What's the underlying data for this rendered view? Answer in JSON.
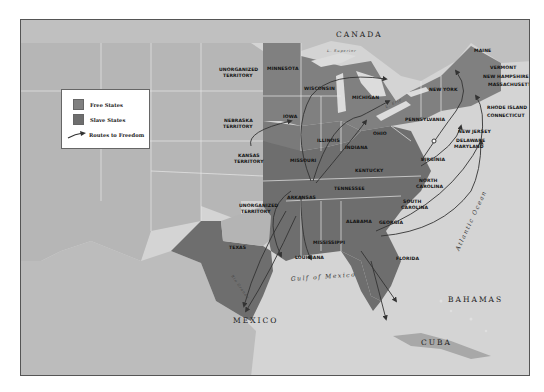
{
  "map": {
    "legend": {
      "items": [
        {
          "label": "Free States",
          "color": "#808080"
        },
        {
          "label": "Slave States",
          "color": "#6e6e6e"
        },
        {
          "label": "Routes to Freedom",
          "icon": "arrow-icon"
        }
      ]
    },
    "regions": {
      "canada": "CANADA",
      "mexico": "MEXICO",
      "bahamas": "BAHAMAS",
      "cuba": "CUBA"
    },
    "water": {
      "gulf": "Gulf of Mexico",
      "atlantic": "Atlantic Ocean",
      "superior": "L. Superior",
      "michigan_lake": "L. Michigan",
      "huron": "L. Huron",
      "erie": "L. Erie",
      "ontario": "L. Ontario",
      "niagara": "Niagara River",
      "st_lawrence": "St. Lawrence River",
      "missouri_river": "Missouri River",
      "arkansas_river": "Arkansas River",
      "ohio_river": "Ohio River",
      "rio_grande": "Rio Grande",
      "mississippi_river": "Mississippi River"
    },
    "territories": {
      "unorganized_north": [
        "UNORGANIZED",
        "TERRITORY"
      ],
      "nebraska": [
        "NEBRASKA",
        "TERRITORY"
      ],
      "kansas": [
        "KANSAS",
        "TERRITORY"
      ],
      "unorganized_south": [
        "UNORGANIZED",
        "TERRITORY"
      ]
    },
    "states": {
      "minnesota": "MINNESOTA",
      "wisconsin": "WISCONSIN",
      "michigan": "MICHIGAN",
      "iowa": "IOWA",
      "illinois": "ILLINOIS",
      "indiana": "INDIANA",
      "ohio": "OHIO",
      "missouri": "MISSOURI",
      "kentucky": "KENTUCKY",
      "tennessee": "TENNESSEE",
      "arkansas": "ARKANSAS",
      "texas": "TEXAS",
      "louisiana": "LOUISIANA",
      "mississippi": "MISSISSIPPI",
      "alabama": "ALABAMA",
      "georgia": "GEORGIA",
      "florida": "FLORIDA",
      "south_carolina": [
        "SOUTH",
        "CAROLINA"
      ],
      "north_carolina": [
        "NORTH",
        "CAROLINA"
      ],
      "virginia": "VIRGINIA",
      "maryland": "MARYLAND",
      "delaware": "DELAWARE",
      "new_jersey": "NEW JERSEY",
      "pennsylvania": "PENNSYLVANIA",
      "new_york": "NEW YORK",
      "maine": "MAINE",
      "vermont": "VERMONT",
      "new_hampshire": "NEW HAMPSHIRE",
      "massachusetts": "MASSACHUSETTS",
      "rhode_island": "RHODE ISLAND",
      "connecticut": "CONNECTICUT"
    },
    "colors": {
      "ocean": "#d2d2d2",
      "territory": "#b4b4b4",
      "free_state": "#808080",
      "slave_state": "#6e6e6e",
      "route": "#3a3a3a",
      "foreign_land": "#bcbcbc"
    }
  }
}
